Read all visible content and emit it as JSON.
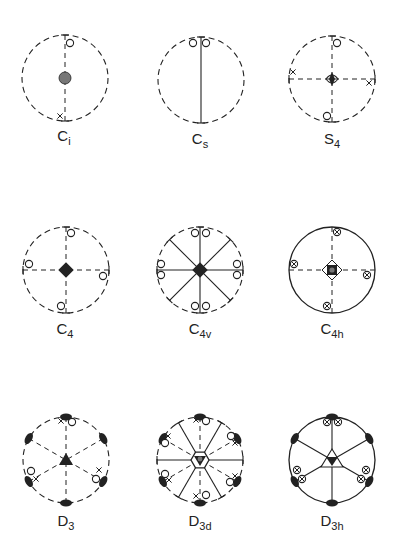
{
  "figure": {
    "colors": {
      "ink": "#222222",
      "fill_gray": "#777777",
      "background": "#ffffff"
    },
    "radius": 43,
    "diagrams": [
      {
        "id": "Ci",
        "symbol": "C",
        "subscript": "i",
        "center": [
          65,
          78
        ],
        "label_pos": [
          64,
          128
        ],
        "circle": "dashed",
        "lines": [
          {
            "angle": 90,
            "style": "dashed",
            "ends": "tick"
          }
        ],
        "center_mark": "gray-dot",
        "poles": [
          {
            "type": "o",
            "x": 70,
            "y": 43
          },
          {
            "type": "x",
            "x": 60,
            "y": 116
          }
        ]
      },
      {
        "id": "Cs",
        "symbol": "C",
        "subscript": "s",
        "center": [
          201,
          80
        ],
        "label_pos": [
          200,
          131
        ],
        "circle": "dashed",
        "lines": [
          {
            "angle": 90,
            "style": "solid",
            "ends": "tick"
          }
        ],
        "center_mark": "none",
        "poles": [
          {
            "type": "o",
            "x": 193,
            "y": 43
          },
          {
            "type": "o",
            "x": 206,
            "y": 43
          }
        ]
      },
      {
        "id": "S4",
        "symbol": "S",
        "subscript": "4",
        "center": [
          332,
          79
        ],
        "label_pos": [
          332,
          131
        ],
        "circle": "dashed",
        "lines": [
          {
            "angle": 90,
            "style": "dashed",
            "ends": "tick"
          },
          {
            "angle": 0,
            "style": "dashed",
            "ends": "tick"
          }
        ],
        "center_mark": "s4",
        "poles": [
          {
            "type": "o",
            "x": 337,
            "y": 43
          },
          {
            "type": "x",
            "x": 293,
            "y": 72
          },
          {
            "type": "x",
            "x": 369,
            "y": 83
          },
          {
            "type": "o",
            "x": 327,
            "y": 116
          }
        ]
      },
      {
        "id": "C4",
        "symbol": "C",
        "subscript": "4",
        "center": [
          66,
          270
        ],
        "label_pos": [
          65,
          321
        ],
        "circle": "dashed",
        "lines": [
          {
            "angle": 90,
            "style": "dashed",
            "ends": "tick"
          },
          {
            "angle": 0,
            "style": "dashed",
            "ends": "tick"
          }
        ],
        "center_mark": "black-square",
        "poles": [
          {
            "type": "o",
            "x": 71,
            "y": 233
          },
          {
            "type": "o",
            "x": 29,
            "y": 264
          },
          {
            "type": "o",
            "x": 103,
            "y": 276
          },
          {
            "type": "o",
            "x": 61,
            "y": 306
          }
        ]
      },
      {
        "id": "C4v",
        "symbol": "C",
        "subscript": "4v",
        "center": [
          200,
          270
        ],
        "label_pos": [
          200,
          321
        ],
        "circle": "dashed",
        "lines": [
          {
            "angle": 90,
            "style": "solid",
            "ends": "tick"
          },
          {
            "angle": 0,
            "style": "solid",
            "ends": "tick"
          },
          {
            "angle": 45,
            "style": "solid",
            "ends": "tick"
          },
          {
            "angle": 135,
            "style": "solid",
            "ends": "tick"
          }
        ],
        "center_mark": "black-square",
        "poles": [
          {
            "type": "o",
            "x": 195,
            "y": 233
          },
          {
            "type": "o",
            "x": 206,
            "y": 233
          },
          {
            "type": "o",
            "x": 161,
            "y": 264
          },
          {
            "type": "o",
            "x": 161,
            "y": 275
          },
          {
            "type": "o",
            "x": 237,
            "y": 264
          },
          {
            "type": "o",
            "x": 237,
            "y": 275
          },
          {
            "type": "o",
            "x": 195,
            "y": 306
          },
          {
            "type": "o",
            "x": 206,
            "y": 306
          }
        ]
      },
      {
        "id": "C4h",
        "symbol": "C",
        "subscript": "4h",
        "center": [
          332,
          270
        ],
        "label_pos": [
          332,
          321
        ],
        "circle": "solid",
        "lines": [
          {
            "angle": 90,
            "style": "dashed",
            "ends": "none"
          },
          {
            "angle": 0,
            "style": "dashed",
            "ends": "none"
          }
        ],
        "center_mark": "c4h",
        "poles": [
          {
            "type": "ox",
            "x": 337,
            "y": 232
          },
          {
            "type": "ox",
            "x": 294,
            "y": 264
          },
          {
            "type": "ox",
            "x": 367,
            "y": 275
          },
          {
            "type": "ox",
            "x": 327,
            "y": 306
          }
        ]
      },
      {
        "id": "D3",
        "symbol": "D",
        "subscript": "3",
        "center": [
          66,
          460
        ],
        "label_pos": [
          66,
          513
        ],
        "circle": "dashed",
        "lines": [
          {
            "angle": 90,
            "style": "dashed",
            "ends": "none"
          },
          {
            "angle": 30,
            "style": "dashed",
            "ends": "none"
          },
          {
            "angle": 150,
            "style": "dashed",
            "ends": "none"
          }
        ],
        "center_mark": "triangle",
        "lenses": [
          90,
          30,
          150,
          210,
          270,
          330
        ],
        "poles": [
          {
            "type": "x",
            "x": 61,
            "y": 421
          },
          {
            "type": "o",
            "x": 72,
            "y": 422
          },
          {
            "type": "o",
            "x": 31,
            "y": 471
          },
          {
            "type": "x",
            "x": 36,
            "y": 479
          },
          {
            "type": "x",
            "x": 99,
            "y": 470
          },
          {
            "type": "o",
            "x": 96,
            "y": 479
          }
        ]
      },
      {
        "id": "D3d",
        "symbol": "D",
        "subscript": "3d",
        "center": [
          200,
          460
        ],
        "label_pos": [
          200,
          513
        ],
        "circle": "dashed",
        "lines": [
          {
            "angle": 90,
            "style": "dashed",
            "ends": "none"
          },
          {
            "angle": 30,
            "style": "dashed",
            "ends": "none"
          },
          {
            "angle": 150,
            "style": "dashed",
            "ends": "none"
          },
          {
            "angle": 0,
            "style": "solid",
            "ends": "tick"
          },
          {
            "angle": 60,
            "style": "solid",
            "ends": "tick"
          },
          {
            "angle": 120,
            "style": "solid",
            "ends": "tick"
          }
        ],
        "center_mark": "d3d",
        "lenses": [
          90,
          30,
          150,
          210,
          270,
          330
        ],
        "poles": [
          {
            "type": "x",
            "x": 196,
            "y": 420
          },
          {
            "type": "o",
            "x": 206,
            "y": 421
          },
          {
            "type": "x",
            "x": 168,
            "y": 436
          },
          {
            "type": "o",
            "x": 165,
            "y": 443
          },
          {
            "type": "o",
            "x": 231,
            "y": 436
          },
          {
            "type": "x",
            "x": 235,
            "y": 443
          },
          {
            "type": "o",
            "x": 165,
            "y": 474
          },
          {
            "type": "x",
            "x": 169,
            "y": 480
          },
          {
            "type": "x",
            "x": 235,
            "y": 476
          },
          {
            "type": "o",
            "x": 230,
            "y": 482
          },
          {
            "type": "x",
            "x": 196,
            "y": 496
          },
          {
            "type": "o",
            "x": 206,
            "y": 495
          }
        ]
      },
      {
        "id": "D3h",
        "symbol": "D",
        "subscript": "3h",
        "center": [
          332,
          460
        ],
        "label_pos": [
          332,
          513
        ],
        "circle": "solid",
        "lines": [
          {
            "angle": 90,
            "style": "solid",
            "ends": "none"
          },
          {
            "angle": 30,
            "style": "solid",
            "ends": "none"
          },
          {
            "angle": 150,
            "style": "solid",
            "ends": "none"
          }
        ],
        "center_mark": "d3h",
        "lenses": [
          90,
          30,
          150,
          210,
          270,
          330
        ],
        "poles": [
          {
            "type": "ox",
            "x": 327,
            "y": 422
          },
          {
            "type": "ox",
            "x": 338,
            "y": 422
          },
          {
            "type": "ox",
            "x": 297,
            "y": 470
          },
          {
            "type": "ox",
            "x": 302,
            "y": 479
          },
          {
            "type": "ox",
            "x": 366,
            "y": 470
          },
          {
            "type": "ox",
            "x": 361,
            "y": 479
          }
        ]
      }
    ]
  }
}
